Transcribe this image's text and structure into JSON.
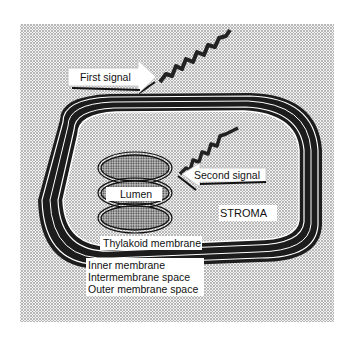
{
  "diagram": {
    "labels": {
      "first_signal": "First signal",
      "second_signal": "Second signal",
      "lumen": "Lumen",
      "stroma": "STROMA",
      "thylakoid_membrane": "Thylakoid membrane",
      "inner_membrane": "Inner membrane",
      "intermembrane_space": "Intermembrane space",
      "outer_membrane_space": "Outer membrane space"
    },
    "colors": {
      "background": "#ffffff",
      "stipple": "#8a8a8a",
      "membrane_dark": "#1a1a1a",
      "label_box": "#ffffff"
    }
  }
}
